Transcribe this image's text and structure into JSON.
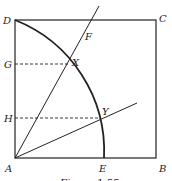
{
  "figure": {
    "caption": "Figure 1.55",
    "labels": {
      "D": "D",
      "C": "C",
      "A": "A",
      "B": "B",
      "E": "E",
      "F": "F",
      "G": "G",
      "H": "H",
      "X": "X",
      "Y": "Y"
    },
    "colors": {
      "stroke": "#222222",
      "background": "#ffffff"
    }
  }
}
